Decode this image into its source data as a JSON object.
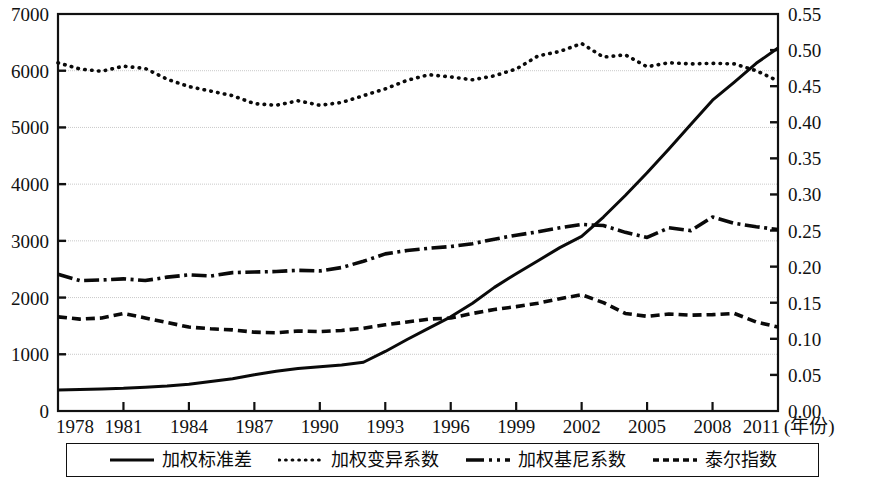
{
  "chart_data": {
    "type": "line",
    "title": "",
    "xlabel": "(年份)",
    "ylabel": "",
    "y2label": "",
    "x": [
      1978,
      1979,
      1980,
      1981,
      1982,
      1983,
      1984,
      1985,
      1986,
      1987,
      1988,
      1989,
      1990,
      1991,
      1992,
      1993,
      1994,
      1995,
      1996,
      1997,
      1998,
      1999,
      2000,
      2001,
      2002,
      2003,
      2004,
      2005,
      2006,
      2007,
      2008,
      2009,
      2010,
      2011
    ],
    "x_tick_labels": [
      "1978",
      "1981",
      "1984",
      "1987",
      "1990",
      "1993",
      "1996",
      "1999",
      "2002",
      "2005",
      "2008",
      "2011"
    ],
    "xlim": [
      1978,
      2011
    ],
    "ylim": [
      0,
      7000
    ],
    "y_ticks": [
      0,
      1000,
      2000,
      3000,
      4000,
      5000,
      6000,
      7000
    ],
    "y_tick_labels": [
      "0",
      "1000",
      "2000",
      "3000",
      "4000",
      "5000",
      "6000",
      "7000"
    ],
    "y2lim": [
      0.0,
      0.55
    ],
    "y2_ticks": [
      0.0,
      0.05,
      0.1,
      0.15,
      0.2,
      0.25,
      0.3,
      0.35,
      0.4,
      0.45,
      0.5,
      0.55
    ],
    "y2_tick_labels": [
      "0.00",
      "0.05",
      "0.10",
      "0.15",
      "0.20",
      "0.25",
      "0.30",
      "0.35",
      "0.40",
      "0.45",
      "0.50",
      "0.55"
    ],
    "grid": true,
    "grid_axis": "y",
    "legend_position": "below",
    "series": [
      {
        "name": "加权标准差",
        "style": "solid",
        "axis": "left",
        "values": [
          370,
          380,
          390,
          400,
          420,
          440,
          470,
          520,
          570,
          640,
          700,
          750,
          780,
          810,
          860,
          1050,
          1260,
          1460,
          1660,
          1900,
          2180,
          2420,
          2650,
          2880,
          3080,
          3420,
          3800,
          4200,
          4620,
          5050,
          5480,
          5800,
          6130,
          6400
        ]
      },
      {
        "name": "加权变异系数",
        "style": "dotted",
        "axis": "right",
        "values": [
          6140,
          6030,
          5990,
          6080,
          6040,
          5850,
          5720,
          5640,
          5560,
          5420,
          5390,
          5470,
          5390,
          5440,
          5560,
          5680,
          5830,
          5930,
          5890,
          5840,
          5910,
          6030,
          6260,
          6340,
          6480,
          6240,
          6280,
          6070,
          6140,
          6120,
          6130,
          6120,
          6000,
          5820
        ]
      },
      {
        "name": "加权基尼系数",
        "style": "dashdot",
        "axis": "right",
        "values": [
          2410,
          2300,
          2310,
          2330,
          2300,
          2360,
          2400,
          2380,
          2440,
          2450,
          2460,
          2480,
          2470,
          2530,
          2640,
          2770,
          2830,
          2870,
          2900,
          2950,
          3030,
          3100,
          3160,
          3230,
          3290,
          3270,
          3150,
          3060,
          3230,
          3180,
          3420,
          3310,
          3250,
          3200
        ]
      },
      {
        "name": "泰尔指数",
        "style": "dashed",
        "axis": "right",
        "values": [
          1660,
          1620,
          1640,
          1720,
          1640,
          1560,
          1480,
          1450,
          1430,
          1390,
          1380,
          1410,
          1400,
          1420,
          1460,
          1520,
          1570,
          1620,
          1640,
          1720,
          1790,
          1840,
          1900,
          1980,
          2050,
          1910,
          1720,
          1670,
          1710,
          1690,
          1700,
          1720,
          1570,
          1480
        ]
      }
    ]
  },
  "legend": {
    "items": [
      {
        "label": "加权标准差",
        "style": "solid"
      },
      {
        "label": "加权变异系数",
        "style": "dotted"
      },
      {
        "label": "加权基尼系数",
        "style": "dashdot"
      },
      {
        "label": "泰尔指数",
        "style": "dashed"
      }
    ]
  }
}
